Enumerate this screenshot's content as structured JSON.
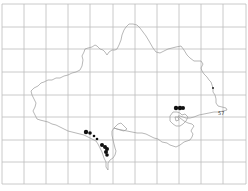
{
  "map": {
    "width": 248,
    "height": 191,
    "grid": {
      "color": "#bdbdbd",
      "vertical_x": [
        2,
        24,
        46,
        68,
        90,
        113,
        135,
        157,
        179,
        201,
        223,
        246
      ],
      "horizontal_y": [
        4,
        27,
        49,
        72,
        95,
        117,
        140,
        162,
        184
      ]
    },
    "outline_color": "#9a9a9a",
    "dot_color": "#111111",
    "label": {
      "text": "57",
      "x": 218,
      "y": 115
    },
    "records": [
      {
        "x": 86,
        "y": 132,
        "r": 2.2
      },
      {
        "x": 90,
        "y": 133,
        "r": 1.8
      },
      {
        "x": 94,
        "y": 136,
        "r": 1.3
      },
      {
        "x": 97,
        "y": 139,
        "r": 1.3
      },
      {
        "x": 102,
        "y": 145,
        "r": 2.0
      },
      {
        "x": 105,
        "y": 147,
        "r": 2.0
      },
      {
        "x": 107,
        "y": 149,
        "r": 2.0
      },
      {
        "x": 106,
        "y": 152,
        "r": 2.0
      },
      {
        "x": 107,
        "y": 155,
        "r": 1.8
      },
      {
        "x": 176,
        "y": 108,
        "r": 2.2
      },
      {
        "x": 180,
        "y": 108,
        "r": 2.2
      },
      {
        "x": 183,
        "y": 108,
        "r": 2.0
      },
      {
        "x": 213,
        "y": 88,
        "r": 0.9
      }
    ]
  }
}
